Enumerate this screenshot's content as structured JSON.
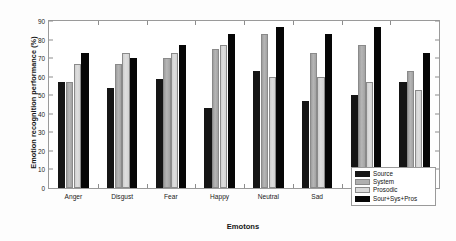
{
  "chart_data": {
    "type": "bar",
    "title": "",
    "xlabel": "Emotons",
    "ylabel": "Emotion recognition performance (%)",
    "ylim": [
      0,
      90
    ],
    "yticks": [
      0,
      10,
      20,
      30,
      40,
      50,
      60,
      70,
      80,
      90
    ],
    "grid": false,
    "legend_position": "bottom-right",
    "categories": [
      "Anger",
      "Disgust",
      "Fear",
      "Happy",
      "Neutral",
      "Sad",
      "Sarcastic",
      "Surprise"
    ],
    "series": [
      {
        "name": "Source",
        "color": "#151515",
        "values": [
          57,
          54,
          59,
          43,
          63,
          47,
          50,
          57
        ]
      },
      {
        "name": "System",
        "color": "#b0b0b0",
        "values": [
          57,
          67,
          70,
          75,
          83,
          73,
          77,
          63
        ]
      },
      {
        "name": "Prosodic",
        "color": "#dadada",
        "values": [
          67,
          73,
          73,
          77,
          60,
          60,
          57,
          53
        ]
      },
      {
        "name": "Sour+Sys+Pros",
        "color": "#060606",
        "values": [
          73,
          70,
          77,
          83,
          87,
          83,
          87,
          73
        ]
      }
    ]
  }
}
